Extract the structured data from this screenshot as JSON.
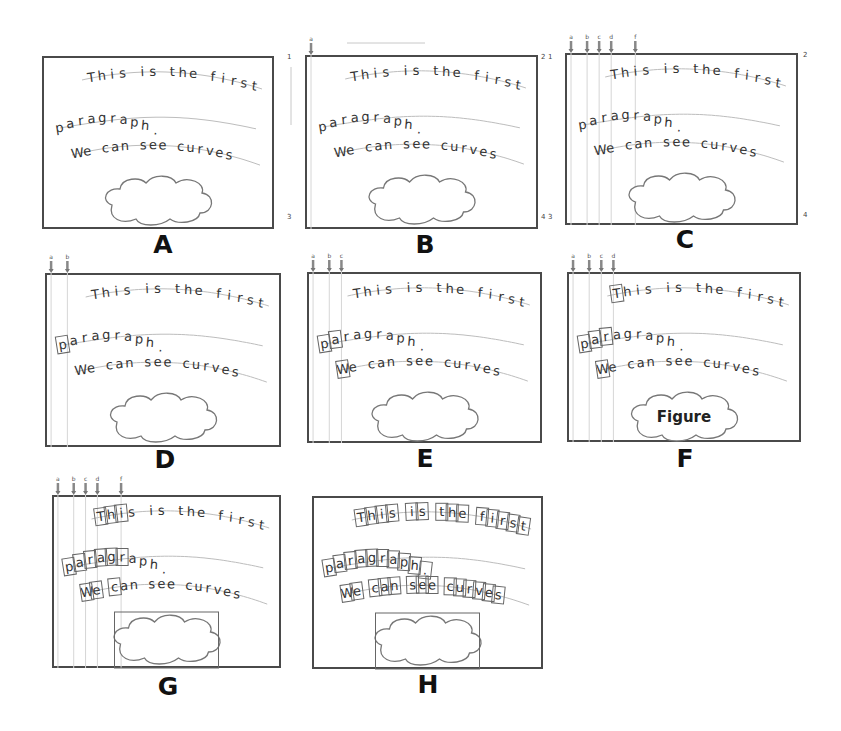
{
  "figure": {
    "text_lines": [
      "This is the first",
      "paragraph.",
      "We can see curves"
    ],
    "figure_label": "Figure"
  },
  "panels": [
    {
      "id": "A",
      "label": "A",
      "column_markers": [],
      "corner_numbers": [],
      "boxed_chars": {
        "line1": 0,
        "line2": 0,
        "line3": 0
      },
      "figure_box": false,
      "figure_text": false
    },
    {
      "id": "B",
      "label": "B",
      "column_markers": [
        "a"
      ],
      "corner_numbers": [
        "1",
        "2",
        "1",
        "3",
        "4",
        "3"
      ],
      "boxed_chars": {
        "line1": 0,
        "line2": 0,
        "line3": 0
      },
      "figure_box": false,
      "figure_text": false
    },
    {
      "id": "C",
      "label": "C",
      "column_markers": [
        "a",
        "b",
        "c",
        "d",
        "f"
      ],
      "corner_numbers": [
        "2",
        "4"
      ],
      "boxed_chars": {
        "line1": 0,
        "line2": 0,
        "line3": 0
      },
      "figure_box": false,
      "figure_text": false
    },
    {
      "id": "D",
      "label": "D",
      "column_markers": [
        "a",
        "b"
      ],
      "corner_numbers": [],
      "boxed_chars": {
        "line1": 0,
        "line2": 1,
        "line3": 0
      },
      "figure_box": false,
      "figure_text": false
    },
    {
      "id": "E",
      "label": "E",
      "column_markers": [
        "a",
        "b",
        "c"
      ],
      "corner_numbers": [],
      "boxed_chars": {
        "line1": 0,
        "line2": 2,
        "line3": 1
      },
      "figure_box": false,
      "figure_text": false
    },
    {
      "id": "F",
      "label": "F",
      "column_markers": [
        "a",
        "b",
        "c",
        "d"
      ],
      "corner_numbers": [],
      "boxed_chars": {
        "line1": 1,
        "line2": 3,
        "line3": 1
      },
      "figure_box": false,
      "figure_text": true
    },
    {
      "id": "G",
      "label": "G",
      "column_markers": [
        "a",
        "b",
        "c",
        "d",
        "f"
      ],
      "corner_numbers": [],
      "boxed_chars": {
        "line1": 3,
        "line2": 6,
        "line3": 3
      },
      "figure_box": true,
      "figure_text": false
    },
    {
      "id": "H",
      "label": "H",
      "column_markers": [],
      "corner_numbers": [],
      "boxed_chars": {
        "line1": 99,
        "line2": 99,
        "line3": 99
      },
      "figure_box": true,
      "figure_text": false
    }
  ],
  "colors": {
    "frame": "#4a4a4a",
    "text": "#333333",
    "guide_curve": "#bdbdbd",
    "marker_arrow": "#888888"
  }
}
